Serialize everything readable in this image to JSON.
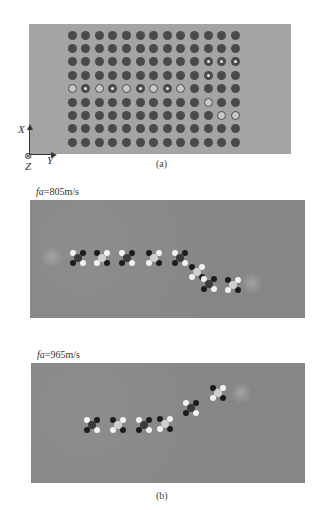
{
  "figure": {
    "panel_a": {
      "caption": "(a)",
      "background_color": "#a4a4a4",
      "rod_color": "#4a4a4a",
      "grid": {
        "rows": 9,
        "cols": 13,
        "origin_x": 72,
        "origin_y": 35,
        "pitch_x": 13.6,
        "pitch_y": 13.4,
        "legend": {
          "S": "solid rod",
          "R": "large hollow ring",
          "H": "small hole rod"
        },
        "layout": [
          "SSSSSSSSSSSSS",
          "SSSSSSSSSSSSS",
          "SSSSSSSSSSHHH",
          "SSSSSSSSSSHSS",
          "RHRHRHRHRSSSS",
          "SSSSSSSSSSRSS",
          "SSSSSSSSSSSRR",
          "SSSSSSSSSSSSS",
          "SSSSSSSSSSSSS"
        ]
      },
      "axes": {
        "x_label": "X",
        "y_label": "Y",
        "z_label": "Z",
        "z_symbol": "⊗"
      }
    },
    "panel_b": {
      "caption": "(b)",
      "plots": [
        {
          "label_prefix": "fa",
          "label_value": "=805m/s",
          "nodes": [
            {
              "x": 48,
              "y": 58
            },
            {
              "x": 72,
              "y": 58
            },
            {
              "x": 97,
              "y": 58
            },
            {
              "x": 124,
              "y": 58
            },
            {
              "x": 150,
              "y": 58
            },
            {
              "x": 167,
              "y": 72
            },
            {
              "x": 179,
              "y": 84
            },
            {
              "x": 203,
              "y": 85
            }
          ],
          "glows": [
            {
              "x": 22,
              "y": 57
            },
            {
              "x": 222,
              "y": 83
            }
          ]
        },
        {
          "label_prefix": "fa",
          "label_value": "=965m/s",
          "nodes": [
            {
              "x": 61,
              "y": 62
            },
            {
              "x": 87,
              "y": 62
            },
            {
              "x": 113,
              "y": 62
            },
            {
              "x": 134,
              "y": 61
            },
            {
              "x": 160,
              "y": 45
            },
            {
              "x": 187,
              "y": 30
            }
          ],
          "glows": [
            {
              "x": 210,
              "y": 30
            }
          ]
        }
      ]
    }
  }
}
